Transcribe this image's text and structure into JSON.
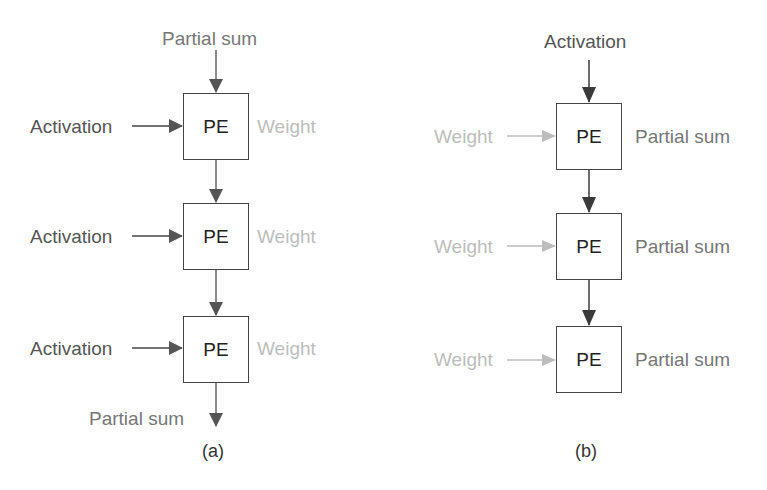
{
  "diagram_a": {
    "caption": "(a)",
    "top_input": "Partial sum",
    "bottom_output": "Partial sum",
    "rows": [
      {
        "left": "Activation",
        "pe": "PE",
        "right": "Weight"
      },
      {
        "left": "Activation",
        "pe": "PE",
        "right": "Weight"
      },
      {
        "left": "Activation",
        "pe": "PE",
        "right": "Weight"
      }
    ]
  },
  "diagram_b": {
    "caption": "(b)",
    "top_input": "Activation",
    "rows": [
      {
        "left": "Weight",
        "pe": "PE",
        "right": "Partial sum"
      },
      {
        "left": "Weight",
        "pe": "PE",
        "right": "Partial sum"
      },
      {
        "left": "Weight",
        "pe": "PE",
        "right": "Partial sum"
      }
    ]
  },
  "colors": {
    "arrow_dark": "#555555",
    "arrow_light": "#bdbdbd",
    "text_dark": "#555555",
    "text_mid": "#777777",
    "text_light": "#bdbdbd"
  }
}
